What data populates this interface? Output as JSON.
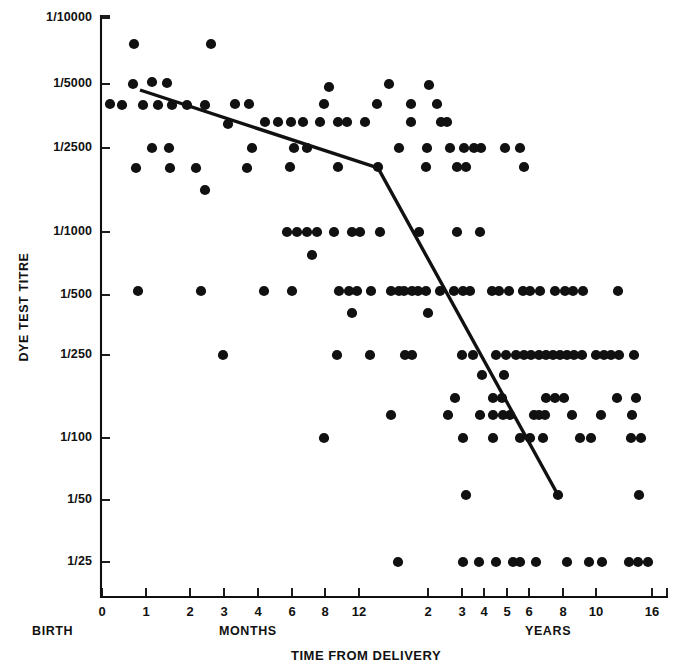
{
  "chart_data": {
    "type": "scatter",
    "title": "",
    "xlabel": "TIME FROM DELIVERY",
    "ylabel": "DYE TEST TITRE",
    "grid": false,
    "legend": null,
    "x_axis": {
      "label": "TIME FROM DELIVERY",
      "region_labels": [
        "BIRTH",
        "MONTHS",
        "YEARS"
      ],
      "tick_labels": [
        "0",
        "1",
        "2",
        "3",
        "4",
        "6",
        "8",
        "12",
        "2",
        "3",
        "4",
        "5",
        "6",
        "8",
        "10",
        "16"
      ],
      "tick_px": [
        102,
        146,
        190,
        224,
        258,
        292,
        325,
        359,
        428,
        462,
        484,
        507,
        529,
        563,
        596,
        652
      ],
      "units": [
        "months",
        "months",
        "months",
        "months",
        "months",
        "months",
        "months",
        "months",
        "years",
        "years",
        "years",
        "years",
        "years",
        "years",
        "years",
        "years"
      ]
    },
    "y_axis": {
      "label": "DYE TEST TITRE",
      "tick_labels": [
        "1/10000",
        "1/5000",
        "1/2500",
        "1/1000",
        "1/500",
        "1/250",
        "1/100",
        "1/50",
        "1/25"
      ],
      "tick_px": [
        18,
        84,
        148,
        232,
        295,
        355,
        438,
        500,
        562
      ],
      "scale": "log-reciprocal-titre"
    },
    "series": [
      {
        "name": "Dye test titre observations",
        "marker": "filled-circle",
        "color": "#111111",
        "points_px": [
          [
            134,
            44
          ],
          [
            211,
            44
          ],
          [
            133,
            84
          ],
          [
            152,
            82
          ],
          [
            167,
            83
          ],
          [
            329,
            87
          ],
          [
            389,
            84
          ],
          [
            429,
            85
          ],
          [
            110,
            104
          ],
          [
            122,
            105
          ],
          [
            143,
            105
          ],
          [
            158,
            105
          ],
          [
            172,
            105
          ],
          [
            187,
            105
          ],
          [
            205,
            105
          ],
          [
            235,
            104
          ],
          [
            249,
            104
          ],
          [
            324,
            104
          ],
          [
            377,
            104
          ],
          [
            411,
            104
          ],
          [
            437,
            104
          ],
          [
            228,
            124
          ],
          [
            265,
            122
          ],
          [
            278,
            122
          ],
          [
            291,
            122
          ],
          [
            303,
            122
          ],
          [
            320,
            122
          ],
          [
            338,
            122
          ],
          [
            347,
            122
          ],
          [
            365,
            122
          ],
          [
            411,
            122
          ],
          [
            441,
            122
          ],
          [
            447,
            122
          ],
          [
            152,
            148
          ],
          [
            169,
            148
          ],
          [
            252,
            148
          ],
          [
            294,
            148
          ],
          [
            307,
            148
          ],
          [
            399,
            148
          ],
          [
            427,
            148
          ],
          [
            450,
            148
          ],
          [
            464,
            148
          ],
          [
            474,
            148
          ],
          [
            481,
            148
          ],
          [
            505,
            148
          ],
          [
            520,
            148
          ],
          [
            136,
            168
          ],
          [
            170,
            168
          ],
          [
            196,
            168
          ],
          [
            247,
            168
          ],
          [
            290,
            167
          ],
          [
            338,
            167
          ],
          [
            378,
            167
          ],
          [
            426,
            167
          ],
          [
            457,
            167
          ],
          [
            466,
            167
          ],
          [
            524,
            167
          ],
          [
            205,
            190
          ],
          [
            287,
            232
          ],
          [
            297,
            232
          ],
          [
            307,
            232
          ],
          [
            317,
            232
          ],
          [
            334,
            232
          ],
          [
            352,
            232
          ],
          [
            360,
            232
          ],
          [
            380,
            232
          ],
          [
            419,
            232
          ],
          [
            457,
            232
          ],
          [
            480,
            232
          ],
          [
            312,
            255
          ],
          [
            138,
            291
          ],
          [
            201,
            291
          ],
          [
            264,
            291
          ],
          [
            292,
            291
          ],
          [
            339,
            291
          ],
          [
            349,
            291
          ],
          [
            357,
            291
          ],
          [
            371,
            291
          ],
          [
            391,
            291
          ],
          [
            399,
            291
          ],
          [
            404,
            291
          ],
          [
            412,
            291
          ],
          [
            418,
            291
          ],
          [
            426,
            291
          ],
          [
            440,
            291
          ],
          [
            454,
            291
          ],
          [
            463,
            291
          ],
          [
            470,
            291
          ],
          [
            492,
            291
          ],
          [
            499,
            291
          ],
          [
            509,
            291
          ],
          [
            523,
            291
          ],
          [
            530,
            291
          ],
          [
            540,
            291
          ],
          [
            555,
            291
          ],
          [
            565,
            291
          ],
          [
            573,
            291
          ],
          [
            583,
            291
          ],
          [
            618,
            291
          ],
          [
            352,
            313
          ],
          [
            428,
            313
          ],
          [
            223,
            355
          ],
          [
            337,
            355
          ],
          [
            370,
            355
          ],
          [
            405,
            355
          ],
          [
            412,
            355
          ],
          [
            462,
            355
          ],
          [
            473,
            355
          ],
          [
            496,
            355
          ],
          [
            506,
            355
          ],
          [
            516,
            355
          ],
          [
            524,
            355
          ],
          [
            531,
            355
          ],
          [
            539,
            355
          ],
          [
            546,
            355
          ],
          [
            553,
            355
          ],
          [
            560,
            355
          ],
          [
            567,
            355
          ],
          [
            574,
            355
          ],
          [
            582,
            355
          ],
          [
            596,
            355
          ],
          [
            604,
            355
          ],
          [
            611,
            355
          ],
          [
            619,
            355
          ],
          [
            634,
            355
          ],
          [
            482,
            375
          ],
          [
            504,
            375
          ],
          [
            455,
            398
          ],
          [
            493,
            398
          ],
          [
            502,
            398
          ],
          [
            546,
            398
          ],
          [
            555,
            398
          ],
          [
            564,
            398
          ],
          [
            617,
            398
          ],
          [
            636,
            398
          ],
          [
            391,
            415
          ],
          [
            448,
            415
          ],
          [
            480,
            415
          ],
          [
            493,
            415
          ],
          [
            503,
            415
          ],
          [
            510,
            415
          ],
          [
            534,
            415
          ],
          [
            539,
            415
          ],
          [
            545,
            415
          ],
          [
            572,
            415
          ],
          [
            601,
            415
          ],
          [
            632,
            415
          ],
          [
            324,
            438
          ],
          [
            463,
            438
          ],
          [
            493,
            438
          ],
          [
            520,
            438
          ],
          [
            530,
            438
          ],
          [
            543,
            438
          ],
          [
            580,
            438
          ],
          [
            591,
            438
          ],
          [
            631,
            438
          ],
          [
            641,
            438
          ],
          [
            466,
            495
          ],
          [
            558,
            495
          ],
          [
            639,
            495
          ],
          [
            398,
            562
          ],
          [
            463,
            562
          ],
          [
            479,
            562
          ],
          [
            496,
            562
          ],
          [
            513,
            562
          ],
          [
            520,
            562
          ],
          [
            536,
            562
          ],
          [
            567,
            562
          ],
          [
            589,
            562
          ],
          [
            602,
            562
          ],
          [
            629,
            562
          ],
          [
            638,
            562
          ],
          [
            648,
            562
          ]
        ],
        "n_points": 160
      }
    ],
    "trend_line": {
      "name": "fitted decay line",
      "color": "#111111",
      "segments_px": [
        [
          140,
          90
        ],
        [
          378,
          168
        ],
        [
          558,
          495
        ]
      ],
      "breakpoint_label": "12 months"
    }
  },
  "axis_titles": {
    "x": "TIME FROM DELIVERY",
    "y": "DYE TEST TITRE"
  },
  "region_labels": {
    "birth": "BIRTH",
    "months": "MONTHS",
    "years": "YEARS"
  }
}
